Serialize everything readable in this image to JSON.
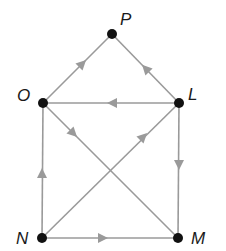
{
  "diagram": {
    "type": "directed-graph",
    "colors": {
      "edge": "#9a9a9a",
      "node": "#111111",
      "label": "#1a1a1a"
    },
    "nodes": [
      {
        "id": "P",
        "label": "P",
        "x": 112,
        "y": 34
      },
      {
        "id": "O",
        "label": "O",
        "x": 43,
        "y": 103
      },
      {
        "id": "L",
        "label": "L",
        "x": 179,
        "y": 103
      },
      {
        "id": "N",
        "label": "N",
        "x": 42,
        "y": 238
      },
      {
        "id": "M",
        "label": "M",
        "x": 178,
        "y": 238
      }
    ],
    "edges": [
      {
        "from": "O",
        "to": "P"
      },
      {
        "from": "L",
        "to": "P"
      },
      {
        "from": "L",
        "to": "O"
      },
      {
        "from": "L",
        "to": "M"
      },
      {
        "from": "N",
        "to": "O"
      },
      {
        "from": "N",
        "to": "L"
      },
      {
        "from": "O",
        "to": "M"
      },
      {
        "from": "N",
        "to": "M"
      }
    ]
  }
}
